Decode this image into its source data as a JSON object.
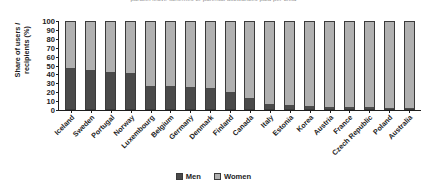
{
  "title_partial": "parallel leave schemes or parental allowances paid per child",
  "legend": {
    "position": "bottom-center",
    "items": [
      {
        "label": "Men",
        "color": "#4a4a4a",
        "name": "men"
      },
      {
        "label": "Women",
        "color": "#b0b0b0",
        "name": "women"
      }
    ]
  },
  "axis": {
    "ylabel_line1": "Share of users /",
    "ylabel_line2": "recipients (%)",
    "yticks": [
      "100",
      "90",
      "80",
      "70",
      "60",
      "50",
      "40",
      "30",
      "20",
      "10",
      "0"
    ]
  },
  "chart_data": {
    "type": "bar",
    "subtype": "stacked-100-percent-vertical",
    "title": "parallel leave schemes or parental allowances paid per child",
    "xlabel": "",
    "ylabel": "Share of users / recipients (%)",
    "ylim": [
      0,
      100
    ],
    "ytick_step": 10,
    "grid": false,
    "legend_position": "bottom-center",
    "categories": [
      "Iceland",
      "Sweden",
      "Portugal",
      "Norway",
      "Luxembourg",
      "Belgium",
      "Germany",
      "Denmark",
      "Finland",
      "Canada",
      "Italy",
      "Estonia",
      "Korea",
      "Austria",
      "France",
      "Czech Republic",
      "Poland",
      "Australia"
    ],
    "series": [
      {
        "name": "Men",
        "color": "#4a4a4a",
        "values": [
          47,
          45,
          43,
          41,
          26,
          26,
          25,
          24,
          19,
          13,
          6,
          5,
          3,
          2,
          2,
          2,
          1,
          1
        ]
      },
      {
        "name": "Women",
        "color": "#b0b0b0",
        "values": [
          53,
          55,
          57,
          59,
          74,
          74,
          75,
          76,
          81,
          87,
          94,
          95,
          97,
          98,
          98,
          98,
          99,
          99
        ]
      }
    ]
  }
}
